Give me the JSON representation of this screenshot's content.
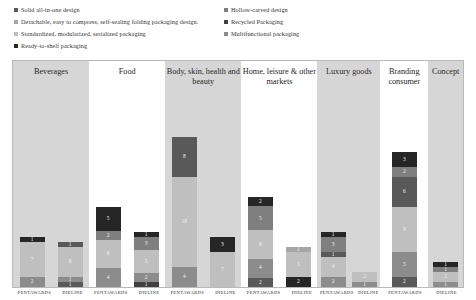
{
  "legend": {
    "items": [
      {
        "label": "Solid all-in-one design",
        "color": "#595959",
        "col": "left",
        "row": 0
      },
      {
        "label": "Hollow-carved design",
        "color": "#7f7f7f",
        "col": "right",
        "row": 0
      },
      {
        "label": "Detachable, easy to compress, self-sealing folding packaging design.",
        "color": "#a6a6a6",
        "col": "left",
        "row": 1
      },
      {
        "label": "Recycled Packaging",
        "color": "#404040",
        "col": "right",
        "row": 1
      },
      {
        "label": "Standardized, modularized, serialized packaging",
        "color": "#bfbfbf",
        "col": "left",
        "row": 2
      },
      {
        "label": "Multifunctional packaging",
        "color": "#8c8c8c",
        "col": "right",
        "row": 2
      },
      {
        "label": "Ready-to-shelf packaging",
        "color": "#262626",
        "col": "left",
        "row": 3
      }
    ]
  },
  "chart_data": {
    "type": "bar",
    "subtype": "stacked-bar-grouped",
    "title": "",
    "xlabel": "",
    "ylabel": "",
    "ylim": [
      0,
      34
    ],
    "grid": false,
    "legend_position": "top",
    "series": [
      {
        "name": "Solid all-in-one design",
        "color": "#595959"
      },
      {
        "name": "Hollow-carved design",
        "color": "#7f7f7f"
      },
      {
        "name": "Detachable, easy to compress, self-sealing folding packaging design.",
        "color": "#a6a6a6"
      },
      {
        "name": "Recycled Packaging",
        "color": "#404040"
      },
      {
        "name": "Standardized, modularized, serialized packaging",
        "color": "#bfbfbf"
      },
      {
        "name": "Multifunctional packaging",
        "color": "#8c8c8c"
      },
      {
        "name": "Ready-to-shelf packaging",
        "color": "#262626"
      }
    ],
    "categories": [
      "Beverages",
      "Food",
      "Body, skin, health and beauty",
      "Home, leisure & other markets",
      "Luxury goods",
      "Branding consumer",
      "Concept"
    ],
    "sources": [
      "PENTAWARDS",
      "DIELINE"
    ],
    "groups": [
      {
        "category": "Beverages",
        "shaded": true,
        "bars": [
          {
            "source": "PENTAWARDS",
            "total": 10,
            "segments": [
              {
                "series": "Ready-to-shelf packaging",
                "value": 1,
                "color": "#262626",
                "label": "1"
              },
              {
                "series": "Standardized, modularized, serialized packaging",
                "value": 7,
                "color": "#bfbfbf",
                "label": "7"
              },
              {
                "series": "Solid all-in-one design",
                "value": 2,
                "color": "#8c8c8c",
                "label": "2"
              }
            ]
          },
          {
            "source": "DIELINE",
            "total": 9,
            "segments": [
              {
                "series": "Ready-to-shelf packaging",
                "value": 1,
                "color": "#595959",
                "label": "1"
              },
              {
                "series": "Standardized, modularized, serialized packaging",
                "value": 6,
                "color": "#bfbfbf",
                "label": "6"
              },
              {
                "series": "Solid all-in-one design",
                "value": 1,
                "color": "#8c8c8c",
                "label": "1"
              },
              {
                "series": "Recycled Packaging",
                "value": 1,
                "color": "#595959",
                "label": "1"
              }
            ]
          }
        ]
      },
      {
        "category": "Food",
        "shaded": false,
        "bars": [
          {
            "source": "PENTAWARDS",
            "total": 16,
            "segments": [
              {
                "series": "Ready-to-shelf packaging",
                "value": 5,
                "color": "#262626",
                "label": "5"
              },
              {
                "series": "Hollow-carved design",
                "value": 2,
                "color": "#7f7f7f",
                "label": "2"
              },
              {
                "series": "Standardized, modularized, serialized packaging",
                "value": 6,
                "color": "#bfbfbf",
                "label": "6"
              },
              {
                "series": "Multifunctional packaging",
                "value": 4,
                "color": "#8c8c8c",
                "label": "4"
              }
            ]
          },
          {
            "source": "DIELINE",
            "total": 11,
            "segments": [
              {
                "series": "Ready-to-shelf packaging",
                "value": 1,
                "color": "#262626",
                "label": "1"
              },
              {
                "series": "Hollow-carved design",
                "value": 3,
                "color": "#7f7f7f",
                "label": "3"
              },
              {
                "series": "Standardized, modularized, serialized packaging",
                "value": 5,
                "color": "#bfbfbf",
                "label": "5"
              },
              {
                "series": "Multifunctional packaging",
                "value": 2,
                "color": "#8c8c8c",
                "label": "2"
              },
              {
                "series": "Recycled Packaging",
                "value": 1,
                "color": "#404040",
                "label": "1"
              }
            ]
          }
        ]
      },
      {
        "category": "Body, skin, health and beauty",
        "shaded": true,
        "bars": [
          {
            "source": "PENTAWARDS",
            "total": 30,
            "segments": [
              {
                "series": "Ready-to-shelf packaging",
                "value": 8,
                "color": "#595959",
                "label": "8"
              },
              {
                "series": "Standardized, modularized, serialized packaging",
                "value": 18,
                "color": "#bfbfbf",
                "label": "18"
              },
              {
                "series": "Multifunctional packaging",
                "value": 4,
                "color": "#8c8c8c",
                "label": "4"
              }
            ]
          },
          {
            "source": "DIELINE",
            "total": 10,
            "segments": [
              {
                "series": "Ready-to-shelf packaging",
                "value": 3,
                "color": "#262626",
                "label": "3"
              },
              {
                "series": "Standardized, modularized, serialized packaging",
                "value": 7,
                "color": "#bfbfbf",
                "label": "7"
              }
            ]
          }
        ]
      },
      {
        "category": "Home, leisure & other markets",
        "shaded": false,
        "bars": [
          {
            "source": "PENTAWARDS",
            "total": 18,
            "segments": [
              {
                "series": "Ready-to-shelf packaging",
                "value": 2,
                "color": "#262626",
                "label": "2"
              },
              {
                "series": "Hollow-carved design",
                "value": 5,
                "color": "#7f7f7f",
                "label": "5"
              },
              {
                "series": "Standardized, modularized, serialized packaging",
                "value": 6,
                "color": "#bfbfbf",
                "label": "6"
              },
              {
                "series": "Multifunctional packaging",
                "value": 4,
                "color": "#8c8c8c",
                "label": "4"
              },
              {
                "series": "Recycled Packaging",
                "value": 2,
                "color": "#595959",
                "label": "2"
              }
            ]
          },
          {
            "source": "DIELINE",
            "total": 8,
            "segments": [
              {
                "series": "Hollow-carved design",
                "value": 1,
                "color": "#a6a6a6",
                "label": "1"
              },
              {
                "series": "Standardized, modularized, serialized packaging",
                "value": 5,
                "color": "#bfbfbf",
                "label": "5"
              },
              {
                "series": "Ready-to-shelf packaging",
                "value": 2,
                "color": "#262626",
                "label": "2"
              }
            ]
          }
        ]
      },
      {
        "category": "Luxury goods",
        "shaded": true,
        "bars": [
          {
            "source": "PENTAWARDS",
            "total": 11,
            "segments": [
              {
                "series": "Ready-to-shelf packaging",
                "value": 1,
                "color": "#262626",
                "label": "1"
              },
              {
                "series": "Hollow-carved design",
                "value": 3,
                "color": "#7f7f7f",
                "label": "3"
              },
              {
                "series": "Solid all-in-one design",
                "value": 1,
                "color": "#595959",
                "label": "1"
              },
              {
                "series": "Standardized, modularized, serialized packaging",
                "value": 4,
                "color": "#bfbfbf",
                "label": "4"
              },
              {
                "series": "Multifunctional packaging",
                "value": 2,
                "color": "#8c8c8c",
                "label": "2"
              }
            ]
          },
          {
            "source": "DIELINE",
            "total": 3,
            "segments": [
              {
                "series": "Standardized, modularized, serialized packaging",
                "value": 2,
                "color": "#bfbfbf",
                "label": "2"
              },
              {
                "series": "Multifunctional packaging",
                "value": 1,
                "color": "#8c8c8c",
                "label": "1"
              }
            ]
          }
        ]
      },
      {
        "category": "Branding consumer",
        "shaded": false,
        "bars": [
          {
            "source": "PENTAWARDS",
            "total": 27,
            "segments": [
              {
                "series": "Ready-to-shelf packaging",
                "value": 3,
                "color": "#262626",
                "label": "3"
              },
              {
                "series": "Hollow-carved design",
                "value": 2,
                "color": "#7f7f7f",
                "label": "2"
              },
              {
                "series": "Solid all-in-one design",
                "value": 6,
                "color": "#595959",
                "label": "6"
              },
              {
                "series": "Standardized, modularized, serialized packaging",
                "value": 9,
                "color": "#bfbfbf",
                "label": "9"
              },
              {
                "series": "Multifunctional packaging",
                "value": 5,
                "color": "#8c8c8c",
                "label": "5"
              },
              {
                "series": "Recycled Packaging",
                "value": 2,
                "color": "#595959",
                "label": "2"
              }
            ]
          }
        ]
      },
      {
        "category": "Concept",
        "shaded": true,
        "bars": [
          {
            "source": "DIELINE",
            "total": 5,
            "segments": [
              {
                "series": "Ready-to-shelf packaging",
                "value": 1,
                "color": "#262626",
                "label": "1"
              },
              {
                "series": "Hollow-carved design",
                "value": 1,
                "color": "#7f7f7f",
                "label": "1"
              },
              {
                "series": "Standardized, modularized, serialized packaging",
                "value": 2,
                "color": "#bfbfbf",
                "label": "2"
              },
              {
                "series": "Multifunctional packaging",
                "value": 1,
                "color": "#8c8c8c",
                "label": "1"
              }
            ]
          }
        ]
      }
    ]
  },
  "axis": {
    "ticks": [
      "PENTAWARDS",
      "DIELINE",
      "PENTAWARDS",
      "DIELINE",
      "PENTAWARDS",
      "DIELINE",
      "PENTAWARDS",
      "DIELINE",
      "PENTAWARDS",
      "DIELINE",
      "PENTAWARDS",
      "DIELINE"
    ]
  }
}
